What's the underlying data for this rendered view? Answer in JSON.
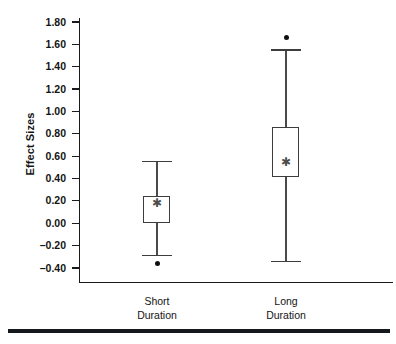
{
  "chart_data": {
    "type": "box",
    "title": "",
    "xlabel": "",
    "ylabel": "Effect Sizes",
    "ylim": [
      -0.4,
      1.8
    ],
    "grid": false,
    "legend": null,
    "ytick_labels": [
      "1.80",
      "1.60",
      "1.40",
      "1.20",
      "1.00",
      "0.80",
      "0.60",
      "0.40",
      "0.20",
      "0.00",
      "-0.20",
      "-0.40"
    ],
    "ytick_values": [
      1.8,
      1.6,
      1.4,
      1.2,
      1.0,
      0.8,
      0.6,
      0.4,
      0.2,
      0.0,
      -0.2,
      -0.4
    ],
    "categories": [
      "Short Duration",
      "Long Duration"
    ],
    "boxes": [
      {
        "name": "Short Duration",
        "label_line1": "Short",
        "label_line2": "Duration",
        "whisker_low": -0.29,
        "q1": 0.0,
        "median": 0.24,
        "mean": 0.18,
        "q3": 0.24,
        "whisker_high": 0.55,
        "outliers": [
          -0.36
        ]
      },
      {
        "name": "Long Duration",
        "label_line1": "Long",
        "label_line2": "Duration",
        "whisker_low": -0.34,
        "q1": 0.41,
        "median": 0.86,
        "mean": 0.55,
        "q3": 0.86,
        "whisker_high": 1.55,
        "outliers": [
          1.66
        ]
      }
    ],
    "marker_symbols": {
      "mean": "✱",
      "outlier": "●"
    },
    "colors": {
      "axis": "#1a1a1a",
      "box_stroke": "#3d3d3d",
      "whisker": "#4a4a4a",
      "outlier": "#0f0f0f",
      "mean": "#4d4d4d",
      "background": "#ffffff",
      "bottom_rule": "#15181d"
    }
  }
}
